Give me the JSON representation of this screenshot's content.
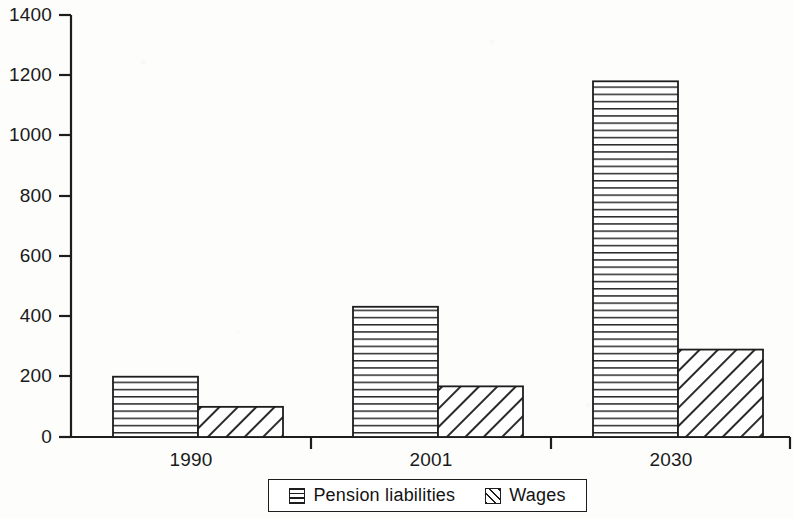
{
  "chart_data": {
    "type": "bar",
    "title": "",
    "subtitle": "",
    "xlabel": "",
    "ylabel": "",
    "categories": [
      "1990",
      "2001",
      "2030"
    ],
    "series": [
      {
        "name": "Pension liabilities",
        "values": [
          200,
          432,
          1180
        ],
        "pattern": "horizontal-lines"
      },
      {
        "name": "Wages",
        "values": [
          100,
          168,
          290
        ],
        "pattern": "diagonal-hatch"
      }
    ],
    "ylim": [
      0,
      1400
    ],
    "ytick_step": 200,
    "yticks": [
      0,
      200,
      400,
      600,
      800,
      1000,
      1200,
      1400
    ],
    "ytick_labels": [
      "0",
      "200",
      "400",
      "600",
      "800",
      "1000",
      "1200",
      "1400"
    ],
    "grid": false,
    "legend_position": "bottom",
    "legend_entries": [
      "Pension liabilities",
      "Wages"
    ],
    "axis_color": "#1d1d1d",
    "bar_fill_color": "#ffffff",
    "bar_edge_color": "#1d1d1d",
    "background_color": "#fdfdfb"
  }
}
